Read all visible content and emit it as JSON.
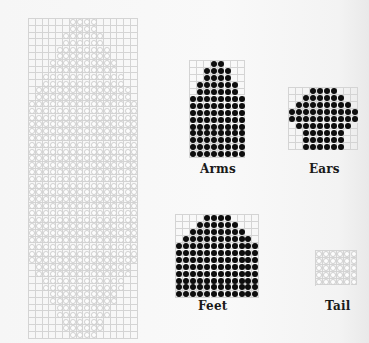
{
  "colors": {
    "filled": "#0d0d0d",
    "open_fill": "#fdfdfd",
    "grid_line": "#d4d4d4",
    "label": "#1a1a1a"
  },
  "pieces": {
    "body": {
      "label": "",
      "style": "open",
      "x": 28,
      "y": 18,
      "cell": 6.8,
      "cols": 16,
      "rows": [
        4,
        4,
        6,
        6,
        8,
        8,
        10,
        10,
        12,
        12,
        14,
        14,
        16,
        16,
        16,
        16,
        16,
        16,
        16,
        16,
        16,
        16,
        16,
        16,
        16,
        16,
        16,
        16,
        16,
        16,
        16,
        16,
        16,
        16,
        16,
        16,
        14,
        14,
        12,
        12,
        10,
        10,
        8,
        8,
        6,
        6,
        4
      ]
    },
    "arms": {
      "label": "Arms",
      "style": "filled",
      "x": 189,
      "y": 60,
      "cell": 6.9,
      "cols": 8,
      "rows": [
        2,
        4,
        4,
        6,
        6,
        8,
        8,
        8,
        8,
        8,
        8,
        8,
        8,
        8
      ],
      "label_x": 200,
      "label_y": 162
    },
    "ears": {
      "label": "Ears",
      "style": "filled",
      "x": 288,
      "y": 87,
      "cell": 6.9,
      "cols": 10,
      "rows": [
        4,
        6,
        8,
        10,
        10,
        8,
        6,
        6,
        6
      ],
      "label_x": 309,
      "label_y": 162
    },
    "feet": {
      "label": "Feet",
      "style": "filled",
      "x": 175,
      "y": 214,
      "cell": 6.9,
      "cols": 12,
      "rows": [
        4,
        6,
        8,
        10,
        12,
        12,
        12,
        12,
        12,
        12,
        12,
        12
      ],
      "label_x": 198,
      "label_y": 299
    },
    "tail": {
      "label": "Tail",
      "style": "open",
      "x": 315,
      "y": 250,
      "cell": 6.9,
      "cols": 6,
      "rows": [
        6,
        6,
        6,
        6,
        6
      ],
      "label_x": 325,
      "label_y": 299
    }
  }
}
